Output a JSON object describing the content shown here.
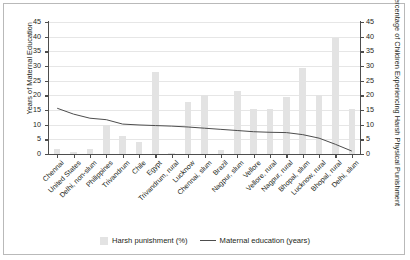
{
  "chart_data": {
    "type": "bar",
    "title": "",
    "subtitle": "",
    "xlabel": "",
    "ylabel": "Years of Maternal Education",
    "y2label": "Percentage of Children Experiencing Harsh Physical Punishment",
    "ylim": [
      0,
      45
    ],
    "y2lim": [
      0,
      45
    ],
    "yticks": [
      0,
      5,
      10,
      15,
      20,
      25,
      30,
      35,
      40,
      45
    ],
    "y2ticks": [
      0,
      5,
      10,
      15,
      20,
      25,
      30,
      35,
      40,
      45
    ],
    "grid": true,
    "legend_position": "bottom",
    "categories": [
      "Chennai",
      "United States",
      "Delhi, non-slum",
      "Philippines",
      "Trivandrum",
      "Chile",
      "Egypt",
      "Trivandrum, rural",
      "Lucknow",
      "Chennai, slum",
      "Brazil",
      "Nagpur, slum",
      "Vellore",
      "Vellore, rural",
      "Nagpur, rural",
      "Bhopal, slum",
      "Lucknow, rural",
      "Bhopal, rural",
      "Delhi, slum"
    ],
    "series": [
      {
        "name": "Harsh punishment (%)",
        "type": "bar",
        "axis": "right",
        "color": "#e3e3e3",
        "values": [
          1.8,
          0.8,
          1.8,
          9.8,
          6.1,
          4.2,
          27.8,
          0.3,
          17.6,
          20.2,
          1.3,
          21.5,
          15.3,
          15.3,
          19.4,
          29.3,
          20.1,
          39.6,
          15.4
        ]
      },
      {
        "name": "Maternal education (years)",
        "type": "line",
        "axis": "left",
        "color": "#4d4d4d",
        "values": [
          15.6,
          13.6,
          12.2,
          11.7,
          10.2,
          9.9,
          9.7,
          9.5,
          9.2,
          8.8,
          8.4,
          8.0,
          7.6,
          7.4,
          7.3,
          6.6,
          5.4,
          3.3,
          1.0
        ]
      }
    ]
  },
  "legend": {
    "items": [
      {
        "label": "Harsh punishment (%)",
        "marker": "swatch"
      },
      {
        "label": "Maternal education (years)",
        "marker": "line"
      }
    ]
  },
  "colors": {
    "bar": "#e3e3e3",
    "line": "#4d4d4d",
    "grid": "#e6e6e6",
    "axis": "#4d4d4d",
    "text": "#231f20",
    "frame": "#b9b9b9",
    "background": "#ffffff"
  }
}
